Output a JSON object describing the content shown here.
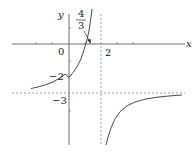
{
  "figure": {
    "function": "y = (3x - 4) / (2 - x)",
    "axis_labels": {
      "x": "x",
      "y": "y"
    },
    "labels": {
      "origin": "0",
      "x_intercept_num": "4",
      "x_intercept_den": "3",
      "vertical_asymptote": "2",
      "y_intercept": "−2",
      "horizontal_asymptote": "−3"
    },
    "asymptotes": {
      "vertical_x": 2,
      "horizontal_y": -3
    },
    "colors": {
      "axis": "#333333",
      "curve": "#333333",
      "dashed": "#777777"
    }
  }
}
